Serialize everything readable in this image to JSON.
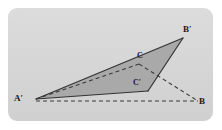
{
  "figure": {
    "panel": {
      "background_color": "#d6d6d6",
      "page_background_color": "#ffffff",
      "x": 8,
      "y": 8,
      "width": 205,
      "height": 113,
      "corner_radius": 9
    },
    "style": {
      "fill_color": "#a9a9a9",
      "stroke_color": "#333333",
      "dashed_stroke_color": "#3a3a3a",
      "label_color": "#1a1a1a",
      "stroke_width": 1.1,
      "dash_pattern": "4,3"
    },
    "points": [
      {
        "name": "A-prime",
        "label": "A′",
        "x": 36,
        "y": 99,
        "label_x": 14,
        "label_y": 94
      },
      {
        "name": "B-prime",
        "label": "B′",
        "x": 183,
        "y": 38,
        "label_x": 183,
        "label_y": 25
      },
      {
        "name": "B",
        "label": "B",
        "x": 198,
        "y": 101,
        "label_x": 199,
        "label_y": 97
      },
      {
        "name": "C",
        "label": "C",
        "x": 139,
        "y": 64,
        "label_x": 137,
        "label_y": 52
      },
      {
        "name": "C-prime",
        "label": "C′",
        "x": 148,
        "y": 91,
        "label_x": 133,
        "label_y": 79
      }
    ],
    "shaded_polygon": {
      "name": "triangle-A-prime-B-prime-C-prime",
      "points": "36,99 183,38 148,91",
      "fill": "#a9a9a9"
    },
    "solid_segments": [
      {
        "name": "segment-A-prime-B-prime",
        "x1": 36,
        "y1": 99,
        "x2": 183,
        "y2": 38
      },
      {
        "name": "segment-B-prime-C-prime",
        "x1": 183,
        "y1": 38,
        "x2": 148,
        "y2": 91
      },
      {
        "name": "segment-A-prime-C-prime",
        "x1": 36,
        "y1": 99,
        "x2": 148,
        "y2": 91
      }
    ],
    "dashed_segments": [
      {
        "name": "segment-A-prime-C",
        "x1": 36,
        "y1": 99,
        "x2": 139,
        "y2": 64
      },
      {
        "name": "segment-C-B",
        "x1": 139,
        "y1": 64,
        "x2": 198,
        "y2": 101
      },
      {
        "name": "segment-A-prime-B",
        "x1": 36,
        "y1": 101,
        "x2": 198,
        "y2": 101
      }
    ]
  }
}
